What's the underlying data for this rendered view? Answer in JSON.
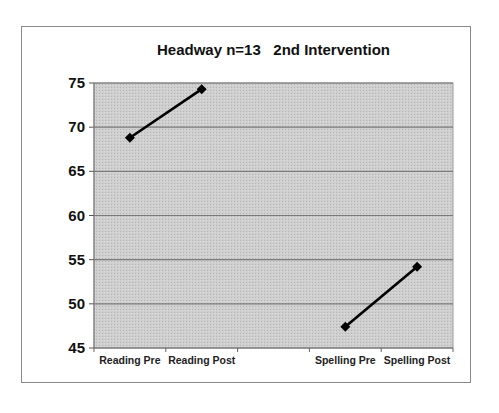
{
  "chart_data": {
    "type": "line",
    "title": "Headway n=13   2nd Intervention",
    "xlabel": "",
    "ylabel": "",
    "categories": [
      "Reading Pre",
      "Reading Post",
      "",
      "Spelling Pre",
      "Spelling Post"
    ],
    "series": [
      {
        "name": "Reading",
        "x": [
          "Reading Pre",
          "Reading Post"
        ],
        "values": [
          68.8,
          74.3
        ]
      },
      {
        "name": "Spelling",
        "x": [
          "Spelling Pre",
          "Spelling Post"
        ],
        "values": [
          47.4,
          54.2
        ]
      }
    ],
    "ylim": [
      45,
      75
    ],
    "yticks": [
      75,
      70,
      65,
      60,
      55,
      50,
      45
    ],
    "grid": true,
    "legend": "none",
    "colors": {
      "plot_background": "#c8c8c8",
      "gridline": "#7a7a7a",
      "line": "#000000",
      "marker": "#000000"
    }
  }
}
